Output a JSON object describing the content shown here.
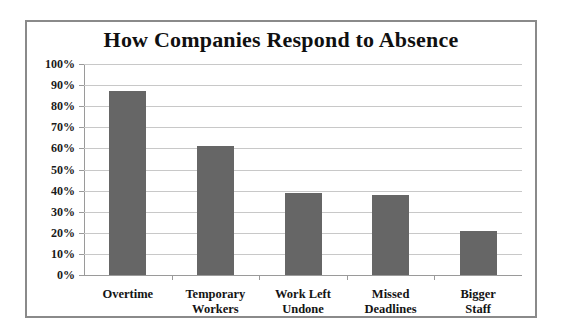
{
  "chart_data": {
    "type": "bar",
    "title": "How Companies Respond to Absence",
    "xlabel": "",
    "ylabel": "",
    "categories": [
      "Overtime",
      "Temporary Workers",
      "Work Left Undone",
      "Missed Deadlines",
      "Bigger Staff"
    ],
    "category_lines": [
      [
        "Overtime"
      ],
      [
        "Temporary",
        "Workers"
      ],
      [
        "Work Left",
        "Undone"
      ],
      [
        "Missed",
        "Deadlines"
      ],
      [
        "Bigger Staff"
      ]
    ],
    "values": [
      87,
      61,
      39,
      38,
      21
    ],
    "value_labels": [
      "87%",
      "61%",
      "39%",
      "38%",
      "21%"
    ],
    "ylim": [
      0,
      100
    ],
    "ytick_values": [
      100,
      90,
      80,
      70,
      60,
      50,
      40,
      30,
      20,
      10,
      0
    ],
    "ytick_labels": [
      "100%",
      "90%",
      "80%",
      "70%",
      "60%",
      "50%",
      "40%",
      "30%",
      "20%",
      "10%",
      "0%"
    ],
    "grid": true,
    "legend": false,
    "bar_color": "#666666",
    "gridline_color": "#c8c8c8",
    "axis_color": "#9a9a9a",
    "border_color": "#8a8a8a",
    "background_color": "#ffffff",
    "title_color": "#101010"
  }
}
